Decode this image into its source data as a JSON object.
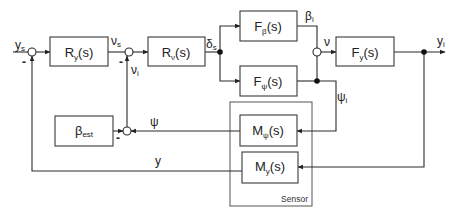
{
  "diagram": {
    "type": "control-block-diagram",
    "blocks": {
      "ry": {
        "main": "R",
        "sub": "y",
        "tail": "(s)"
      },
      "rv": {
        "main": "R",
        "sub": "ν",
        "tail": "(s)"
      },
      "fbeta": {
        "main": "F",
        "sub": "β",
        "tail": "(s)"
      },
      "fpsi": {
        "main": "F",
        "sub": "ψ",
        "tail": "(s)"
      },
      "fy": {
        "main": "F",
        "sub": "y",
        "tail": "(s)"
      },
      "mpsi": {
        "main": "M",
        "sub": "ψ",
        "tail": "(s)"
      },
      "my": {
        "main": "M",
        "sub": "y",
        "tail": "(s)"
      },
      "best": {
        "main": "β",
        "sub": "est",
        "tail": ""
      }
    },
    "signals": {
      "ys": {
        "main": "y",
        "sub": "s"
      },
      "nus": {
        "main": "ν",
        "sub": "s"
      },
      "nui": {
        "main": "ν",
        "sub": "i"
      },
      "deltas": {
        "main": "δ",
        "sub": "s"
      },
      "betai": {
        "main": "β",
        "sub": "i"
      },
      "nu": {
        "main": "ν",
        "sub": ""
      },
      "yi": {
        "main": "y",
        "sub": "i"
      },
      "psii": {
        "main": "ψ",
        "sub": "i"
      },
      "psi": {
        "main": "ψ",
        "sub": ""
      },
      "y": {
        "main": "y",
        "sub": ""
      }
    },
    "sum_signs": {
      "ys_minus": "-",
      "nus_minus": "-",
      "psi_minus": "-"
    },
    "group_label": "Sensor"
  }
}
